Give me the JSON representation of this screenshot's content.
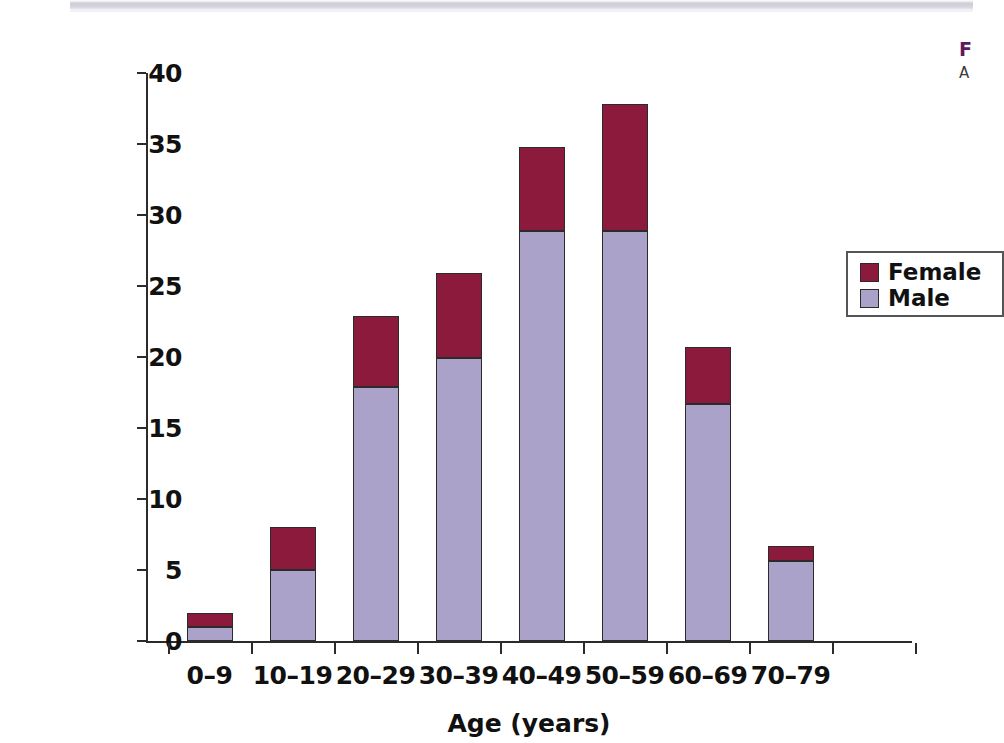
{
  "figure": {
    "background_color": "#ffffff",
    "scan_strip_color": "#d2ced9"
  },
  "caption": {
    "heading": "F",
    "lines": "A\ni\ne"
  },
  "legend": {
    "position": "inside-top-right",
    "items": [
      {
        "label": "Female",
        "color": "#8b1a3d"
      },
      {
        "label": "Male",
        "color": "#aaa2c8"
      }
    ]
  },
  "chart_data": {
    "type": "bar",
    "subtype": "stacked-vertical",
    "title": "",
    "subtitle": "",
    "xlabel": "Age (years)",
    "ylabel": "Number of patients",
    "categories": [
      "0–9",
      "10–19",
      "20–29",
      "30–39",
      "40–49",
      "50–59",
      "60–69",
      "70–79"
    ],
    "series": [
      {
        "name": "Male",
        "color": "#aaa2c8",
        "values": [
          1,
          5,
          17.9,
          19.9,
          28.9,
          28.9,
          16.7,
          5.6
        ]
      },
      {
        "name": "Female",
        "color": "#8b1a3d",
        "values": [
          1,
          3,
          5,
          6,
          5.9,
          8.9,
          4,
          1.1
        ]
      }
    ],
    "totals": [
      2,
      8,
      22.9,
      25.9,
      34.8,
      37.8,
      20.7,
      6.7
    ],
    "ylim": [
      0,
      40
    ],
    "yticks": [
      0,
      5,
      10,
      15,
      20,
      25,
      30,
      35,
      40
    ],
    "ytick_labels": [
      "0",
      "5",
      "10",
      "15",
      "20",
      "25",
      "30",
      "35",
      "40"
    ],
    "grid": false,
    "legend_position": "inside-top-right",
    "bar_edge_color": "#2b2b2b",
    "axis_color": "#2b2b2b"
  }
}
